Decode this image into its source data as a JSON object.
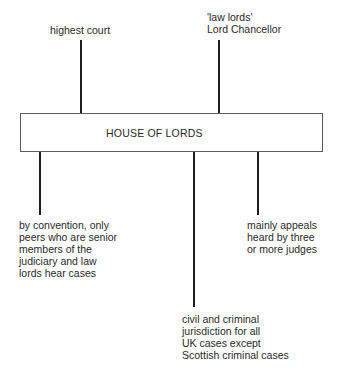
{
  "diagram": {
    "central_node": {
      "label": "HOUSE OF LORDS"
    },
    "top_labels": [
      {
        "lines": [
          "highest court"
        ]
      },
      {
        "lines": [
          "'law lords'",
          "Lord Chancellor"
        ]
      }
    ],
    "bottom_labels": [
      {
        "lines": [
          "by convention, only",
          "peers who are senior",
          "members of the",
          "judiciary and law",
          "lords hear cases"
        ]
      },
      {
        "lines": [
          "civil and criminal",
          "jurisdiction for all",
          "UK cases except",
          "Scottish criminal cases"
        ]
      },
      {
        "lines": [
          "mainly appeals",
          "heard by three",
          "or more judges"
        ]
      }
    ],
    "colors": {
      "line": "#1e1e1e",
      "box_border": "#5a5a5a",
      "text": "#2a2a2a"
    }
  }
}
